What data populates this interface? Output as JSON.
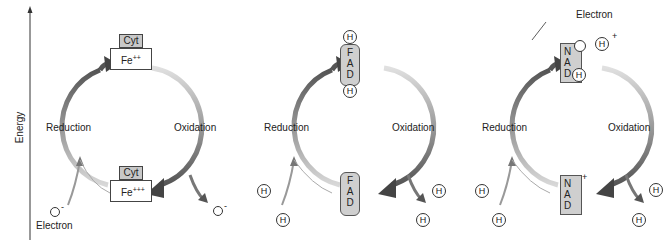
{
  "axis": {
    "label": "Energy",
    "direction": "up"
  },
  "panels": [
    {
      "id": "cytochrome",
      "reduced_top": {
        "carrier": "Cyt",
        "ion": "Fe",
        "charge": "++"
      },
      "oxidized_bottom": {
        "carrier": "Cyt",
        "ion": "Fe",
        "charge": "+++"
      },
      "left_label": "Reduction",
      "right_label": "Oxidation",
      "input_label": "Electron",
      "input_symbol": "-",
      "output_symbol": "-"
    },
    {
      "id": "fad",
      "top": {
        "letters": [
          "F",
          "A",
          "D"
        ],
        "bound": [
          "H",
          "H"
        ]
      },
      "bottom": {
        "letters": [
          "F",
          "A",
          "D"
        ]
      },
      "left_label": "Reduction",
      "right_label": "Oxidation",
      "inputs": [
        "H",
        "H"
      ],
      "outputs": [
        "H",
        "H"
      ]
    },
    {
      "id": "nad",
      "top": {
        "letters": [
          "N",
          "A",
          "D"
        ],
        "bound": "H",
        "electron_label": "Electron"
      },
      "free_proton": {
        "symbol": "H",
        "charge": "+"
      },
      "bottom": {
        "letters": [
          "N",
          "A",
          "D"
        ],
        "charge": "+"
      },
      "left_label": "Reduction",
      "right_label": "Oxidation",
      "inputs": [
        "H",
        "H"
      ],
      "outputs": [
        "H",
        "H"
      ]
    }
  ]
}
